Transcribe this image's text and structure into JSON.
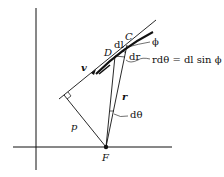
{
  "diagram": {
    "labels": {
      "C": "C",
      "D": "D",
      "dl": "dl",
      "phi": "ϕ",
      "dr": "dr",
      "relation": "rdθ = dl sin ϕ",
      "v": "v",
      "r": "r",
      "dtheta": "dθ",
      "p": "p",
      "F": "F"
    },
    "colors": {
      "ink": "#111111",
      "background": "#ffffff"
    }
  }
}
